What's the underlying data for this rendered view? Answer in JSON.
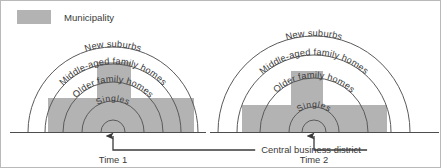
{
  "legend": {
    "swatch_color": "#b3b3b3",
    "label": "Municipality"
  },
  "diagrams": [
    {
      "id": "time-1",
      "caption": "Time 1",
      "rings": [
        {
          "name": "singles",
          "label": "Singles"
        },
        {
          "name": "older-family-homes",
          "label": "Older family homes"
        },
        {
          "name": "middle-aged-family-homes",
          "label": "Middle-aged family homes"
        },
        {
          "name": "new-suburbs",
          "label": "New suburbs"
        }
      ]
    },
    {
      "id": "time-2",
      "caption": "Time 2",
      "rings": [
        {
          "name": "singles",
          "label": "Singles"
        },
        {
          "name": "older-family-homes",
          "label": "Older family homes"
        },
        {
          "name": "middle-aged-family-homes",
          "label": "Middle-aged family homes"
        },
        {
          "name": "new-suburbs",
          "label": "New suburbs"
        }
      ]
    }
  ],
  "annotation": {
    "label": "Central business district"
  },
  "colors": {
    "municipality_fill": "#b3b3b3",
    "arc_stroke": "#5a5a5a",
    "baseline": "#4d4d4d",
    "text": "#3a3a3a",
    "frame": "#b9b9b9",
    "background": "#ffffff"
  }
}
